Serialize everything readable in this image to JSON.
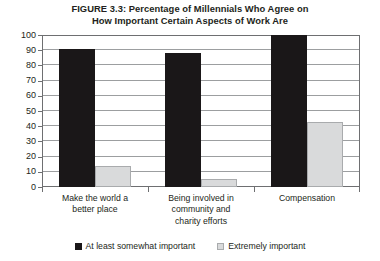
{
  "chart_data": {
    "type": "bar",
    "title": "FIGURE 3.3: Percentage of Millennials Who Agree on How Important Certain Aspects of Work Are",
    "title_lines": [
      "FIGURE 3.3: Percentage of Millennials Who Agree on",
      "How Important Certain Aspects of Work Are"
    ],
    "categories": [
      "Make the world a better place",
      "Being involved in community and charity efforts",
      "Compensation"
    ],
    "category_lines": [
      [
        "Make the world a",
        "better place"
      ],
      [
        "Being involved in",
        "community and",
        "charity efforts"
      ],
      [
        "Compensation"
      ]
    ],
    "series": [
      {
        "name": "At least somewhat important",
        "color": "#1a1718",
        "values": [
          91,
          88,
          100
        ]
      },
      {
        "name": "Extremely important",
        "color": "#d9dadb",
        "values": [
          14,
          5,
          43
        ]
      }
    ],
    "xlabel": "",
    "ylabel": "",
    "ylim": [
      0,
      100
    ],
    "ytick_step": 10,
    "yticks": [
      0,
      10,
      20,
      30,
      40,
      50,
      60,
      70,
      80,
      90,
      100
    ],
    "ytick_labels": [
      "0",
      "10",
      "20",
      "30",
      "40",
      "50",
      "60",
      "70",
      "80",
      "90",
      "100"
    ],
    "grid": true,
    "legend_position": "bottom"
  }
}
